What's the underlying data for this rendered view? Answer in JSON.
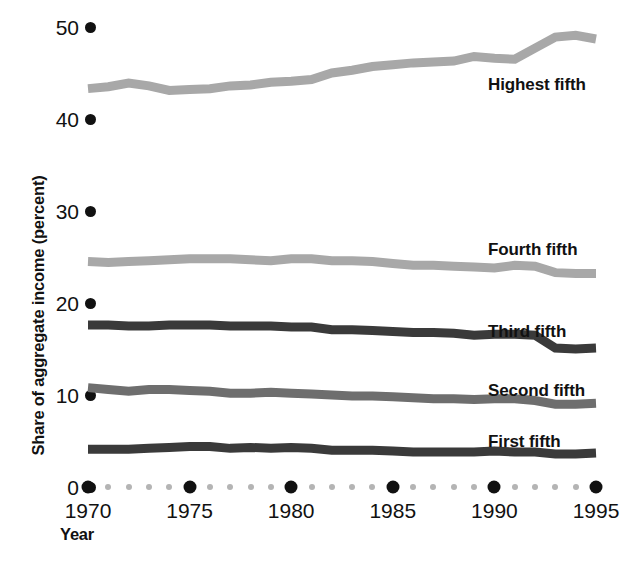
{
  "chart_data": {
    "type": "line",
    "title": "",
    "xlabel": "Year",
    "ylabel": "Share of aggregate income (percent)",
    "xlim": [
      1970,
      1995
    ],
    "ylim": [
      0,
      50
    ],
    "xticks": [
      "1970",
      "1975",
      "1980",
      "1985",
      "1990",
      "1995"
    ],
    "yticks": [
      "0",
      "10",
      "20",
      "30",
      "40",
      "50"
    ],
    "grid": false,
    "legend_position": "inline-right",
    "x": [
      1970,
      1971,
      1972,
      1973,
      1974,
      1975,
      1976,
      1977,
      1978,
      1979,
      1980,
      1981,
      1982,
      1983,
      1984,
      1985,
      1986,
      1987,
      1988,
      1989,
      1990,
      1991,
      1992,
      1993,
      1994,
      1995
    ],
    "series": [
      {
        "name": "Highest fifth",
        "color": "#a8a8a8",
        "label_x": 488,
        "label_y": 75,
        "values": [
          43.3,
          43.5,
          43.9,
          43.6,
          43.1,
          43.2,
          43.3,
          43.6,
          43.7,
          44.0,
          44.1,
          44.3,
          45.0,
          45.3,
          45.7,
          45.9,
          46.1,
          46.2,
          46.3,
          46.8,
          46.6,
          46.5,
          47.7,
          48.9,
          49.1,
          48.7
        ]
      },
      {
        "name": "Fourth fifth",
        "color": "#a8a8a8",
        "label_x": 488,
        "label_y": 240,
        "values": [
          24.5,
          24.4,
          24.5,
          24.6,
          24.7,
          24.8,
          24.8,
          24.8,
          24.7,
          24.6,
          24.8,
          24.8,
          24.6,
          24.6,
          24.5,
          24.3,
          24.1,
          24.1,
          24.0,
          23.9,
          23.8,
          24.1,
          24.0,
          23.3,
          23.2,
          23.2
        ]
      },
      {
        "name": "Third fifth",
        "color": "#3a3a3a",
        "label_x": 488,
        "label_y": 322,
        "values": [
          17.6,
          17.6,
          17.5,
          17.5,
          17.6,
          17.6,
          17.6,
          17.5,
          17.5,
          17.5,
          17.4,
          17.4,
          17.1,
          17.1,
          17.0,
          16.9,
          16.8,
          16.8,
          16.7,
          16.5,
          16.6,
          16.6,
          16.5,
          15.1,
          15.0,
          15.1
        ]
      },
      {
        "name": "Second fifth",
        "color": "#6e6e6e",
        "label_x": 488,
        "label_y": 381,
        "values": [
          10.8,
          10.6,
          10.4,
          10.6,
          10.6,
          10.5,
          10.4,
          10.2,
          10.2,
          10.3,
          10.2,
          10.1,
          10.0,
          9.9,
          9.9,
          9.8,
          9.7,
          9.6,
          9.6,
          9.5,
          9.6,
          9.6,
          9.4,
          9.0,
          9.0,
          9.1
        ]
      },
      {
        "name": "First fifth",
        "color": "#3a3a3a",
        "label_x": 488,
        "label_y": 432,
        "values": [
          4.1,
          4.1,
          4.1,
          4.2,
          4.3,
          4.4,
          4.4,
          4.2,
          4.3,
          4.2,
          4.3,
          4.2,
          4.0,
          4.0,
          4.0,
          3.9,
          3.8,
          3.8,
          3.8,
          3.8,
          3.9,
          3.8,
          3.8,
          3.6,
          3.6,
          3.7
        ]
      }
    ]
  },
  "axes": {
    "y_ticks": [
      {
        "label": "50",
        "value": 50
      },
      {
        "label": "40",
        "value": 40
      },
      {
        "label": "30",
        "value": 30
      },
      {
        "label": "20",
        "value": 20
      },
      {
        "label": "10",
        "value": 10
      },
      {
        "label": "0",
        "value": 0
      }
    ],
    "x_ticks": [
      {
        "label": "1970",
        "value": 1970
      },
      {
        "label": "1975",
        "value": 1975
      },
      {
        "label": "1980",
        "value": 1980
      },
      {
        "label": "1985",
        "value": 1985
      },
      {
        "label": "1990",
        "value": 1990
      },
      {
        "label": "1995",
        "value": 1995
      }
    ],
    "x_title": "Year",
    "y_title": "Share of aggregate income (percent)"
  },
  "plot_geometry": {
    "x0_px": 88,
    "x1_px": 596,
    "y0_px": 487,
    "y_per_unit_px": 9.2,
    "line_width_px": 9
  }
}
